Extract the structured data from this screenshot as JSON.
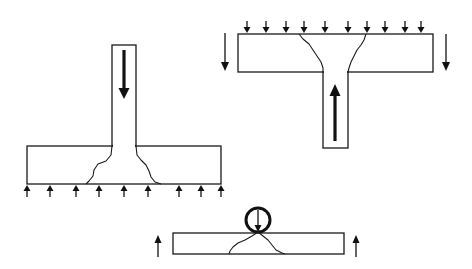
{
  "diagram": {
    "colors": {
      "stroke": "#1a1a1a",
      "background": "#ffffff"
    },
    "panels": [
      {
        "id": "column-footing",
        "label": "",
        "column": {
          "x": 112,
          "y": 45,
          "w": 24,
          "h": 101
        },
        "slab": {
          "x": 27,
          "y": 146,
          "w": 194,
          "h": 38
        },
        "load_arrow": {
          "direction": "down",
          "x": 124,
          "y1": 50,
          "y2": 98
        },
        "reaction_arrows_up_x": [
          27,
          50,
          76,
          99,
          124,
          148,
          179,
          201,
          221
        ]
      },
      {
        "id": "inverted-column-slab",
        "label": "",
        "slab": {
          "x": 238,
          "y": 34,
          "w": 195,
          "h": 38
        },
        "column": {
          "x": 323,
          "y": 72,
          "w": 25,
          "h": 76
        },
        "load_arrow": {
          "direction": "up",
          "x": 335,
          "y1": 141,
          "y2": 84
        },
        "distributed_down_x": [
          247,
          266,
          286,
          304,
          325,
          348,
          367,
          385,
          405,
          421
        ],
        "edge_arrows_down": [
          {
            "x": 225,
            "y1": 33,
            "y2": 70
          },
          {
            "x": 446,
            "y1": 34,
            "y2": 70
          }
        ]
      },
      {
        "id": "point-load-beam",
        "label": "",
        "beam": {
          "x": 173,
          "y": 233,
          "w": 171,
          "h": 21
        },
        "roller": {
          "cx": 258,
          "cy": 220,
          "r": 12
        },
        "edge_arrows_up": [
          {
            "x": 158,
            "y1": 257,
            "y2": 235
          },
          {
            "x": 356,
            "y1": 257,
            "y2": 235
          }
        ]
      }
    ]
  }
}
